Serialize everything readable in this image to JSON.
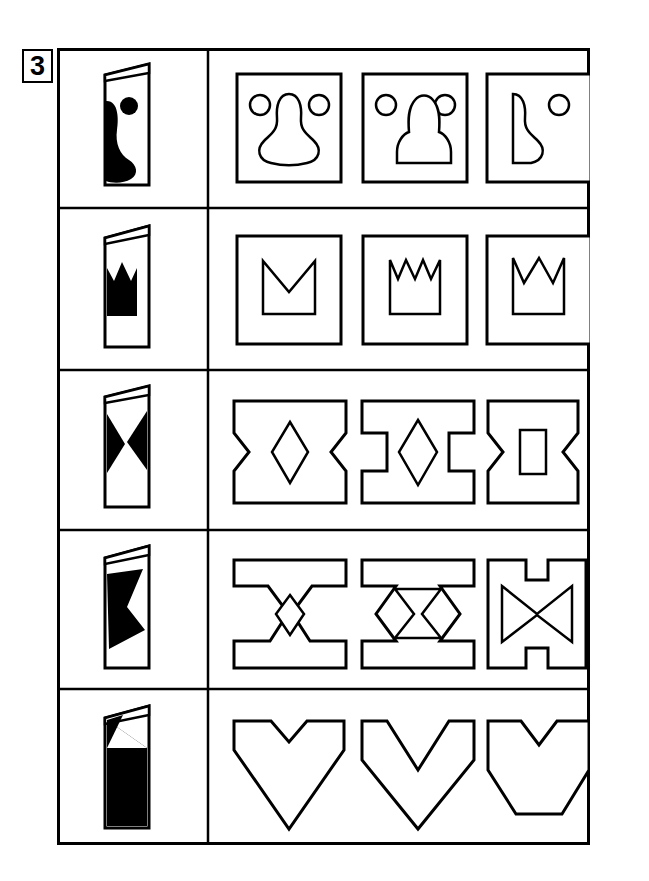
{
  "exercise": {
    "number": "3",
    "type": "paper-folding-punch-visual-reasoning-worksheet",
    "columns": [
      "folded-paper-prompt",
      "option-1",
      "option-2",
      "option-3"
    ],
    "row_count": 5,
    "option_count_per_row": 3
  },
  "colors": {
    "ink": "#000000",
    "paper": "#ffffff",
    "fill": "#000000"
  },
  "grid": {
    "outer_border_width": 3,
    "inner_line_width": 2,
    "divider_x": 151,
    "row_heights": [
      160,
      162,
      160,
      159,
      156
    ]
  },
  "rows": [
    {
      "id": "row-1",
      "prompt": {
        "name": "folded-card-blob-and-dot",
        "description": "Folded card with a black curved blob on the left edge and a small black filled circle",
        "shapes": [
          "blob",
          "dot"
        ]
      },
      "options": [
        {
          "id": "row-1-option-1",
          "name": "option-bell-with-two-circles-framed",
          "description": "Square frame containing a bell/pear outline flanked by two small circles",
          "framed": true
        },
        {
          "id": "row-1-option-2",
          "name": "option-dome-with-two-circles-framed",
          "description": "Square frame containing a domed arch outline flanked by two small circles",
          "framed": true
        },
        {
          "id": "row-1-option-3",
          "name": "option-half-blob-with-one-circle-framed",
          "description": "Square frame containing a half blob shape and one small circle",
          "framed": true
        }
      ]
    },
    {
      "id": "row-2",
      "prompt": {
        "name": "folded-card-crown-half",
        "description": "Folded card with a black half-crown (two points) on the fold edge",
        "shapes": [
          "half-crown"
        ]
      },
      "options": [
        {
          "id": "row-2-option-1",
          "name": "option-single-v-notch-box-framed",
          "description": "Square frame containing a box with one V notch in the top edge",
          "framed": true
        },
        {
          "id": "row-2-option-2",
          "name": "option-four-point-crown-framed",
          "description": "Square frame containing a four point crown",
          "framed": true
        },
        {
          "id": "row-2-option-3",
          "name": "option-three-point-crown-framed",
          "description": "Square frame containing a three point crown",
          "framed": true
        }
      ]
    },
    {
      "id": "row-3",
      "prompt": {
        "name": "folded-card-bowtie-halves",
        "description": "Folded card with black triangular wedges forming a bowtie at the fold",
        "shapes": [
          "bowtie"
        ]
      },
      "options": [
        {
          "id": "row-3-option-1",
          "name": "option-concave-block-with-diamond-hole",
          "description": "Block with concave notched left and right sides and a diamond hole in the centre",
          "framed": false
        },
        {
          "id": "row-3-option-2",
          "name": "option-i-beam-with-diamond-hole",
          "description": "I-beam / H shape with square notched sides and a diamond hole in the centre",
          "framed": false
        },
        {
          "id": "row-3-option-3",
          "name": "option-concave-block-with-rectangle-hole",
          "description": "Block with concave notched sides and a rectangular hole in the centre",
          "framed": false
        }
      ]
    },
    {
      "id": "row-4",
      "prompt": {
        "name": "folded-card-zigzag-block",
        "description": "Folded card with a large black zigzag arrow notched block",
        "shapes": [
          "zigzag-block"
        ]
      },
      "options": [
        {
          "id": "row-4-option-1",
          "name": "option-flanged-ibeam-with-diamond-hole",
          "description": "Flanged I-beam outline with chevron sides and a diamond hole in the centre",
          "framed": false
        },
        {
          "id": "row-4-option-2",
          "name": "option-flanged-block-with-hourglass-hole",
          "description": "Flanged block with chevron sides and an hourglass hole in the centre",
          "framed": false
        },
        {
          "id": "row-4-option-3",
          "name": "option-notched-block-with-bowtie-hole",
          "description": "Block with top and bottom notches and a bowtie hole in the centre",
          "framed": false
        }
      ]
    },
    {
      "id": "row-5",
      "prompt": {
        "name": "folded-card-diagonal-fill",
        "description": "Folded card filled black below a diagonal line",
        "shapes": [
          "diagonal-triangle"
        ]
      },
      "options": [
        {
          "id": "row-5-option-1",
          "name": "option-heart-arrow-point-down",
          "description": "Wide V / heart-like polygon with a narrow notch at top and a sharp point at the bottom",
          "framed": false
        },
        {
          "id": "row-5-option-2",
          "name": "option-chevron-arrow-point-down",
          "description": "Chevron shape with a deep wide notch at top and a sharp point at the bottom",
          "framed": false
        },
        {
          "id": "row-5-option-3",
          "name": "option-heart-flat-bottom",
          "description": "Heart-like polygon with a notch at top and a flat bottom edge",
          "framed": false
        }
      ]
    }
  ]
}
